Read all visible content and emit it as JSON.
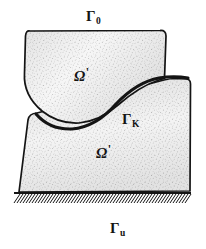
{
  "figure": {
    "background_color": "#ffffff",
    "ink_color": "#141414",
    "fill_color": "#fbfbfb",
    "stipple_color": "#8a8a8a",
    "labels": [
      {
        "id": "gamma-0",
        "name": "gamma-zero-label",
        "base": "Γ",
        "subscript": "0",
        "prime": "",
        "meaning": "traction / free boundary of upper body",
        "x": 86,
        "y": 8
      },
      {
        "id": "omega-upper",
        "name": "omega-upper-label",
        "base": "Ω",
        "subscript": "",
        "prime": "'",
        "meaning": "upper body domain",
        "x": 74,
        "y": 66
      },
      {
        "id": "gamma-k",
        "name": "gamma-k-label",
        "base": "Γ",
        "subscript": "K",
        "prime": "",
        "meaning": "contact boundary between bodies",
        "x": 122,
        "y": 111
      },
      {
        "id": "omega-lower",
        "name": "omega-lower-label",
        "base": "Ω",
        "subscript": "",
        "prime": "'",
        "meaning": "lower body domain",
        "x": 96,
        "y": 143
      },
      {
        "id": "gamma-u",
        "name": "gamma-u-label",
        "base": "Γ",
        "subscript": "u",
        "prime": "",
        "meaning": "fixed displacement boundary at base",
        "x": 110,
        "y": 220
      }
    ],
    "geometry": {
      "upper_body": {
        "name": "upper-body-shape",
        "path": "M 30 31 Q 26 30 25.5 36 L 24.5 73 Q 23 95 42 111 Q 58 124 79 123 Q 100 121 118 105 Q 140 86 159 80 L 164.5 78.5 L 166 36 Q 166 30 160 30.5 Z"
      },
      "lower_body": {
        "name": "lower-body-shape",
        "path": "M 37 113 L 164 80 Q 170 78.5 175 78.5 L 186 79 Q 190.5 79 190.5 84 L 190 191 L 19 192 L 28 120 Q 29 113.5 37 113 Z"
      },
      "contact_curve": {
        "name": "contact-curve-gamma-k",
        "path": "M 36 114 Q 50 130 72 129 Q 96 127 116 104 Q 137 82 159 78 Q 174 75.5 188 78"
      },
      "ground_line": {
        "name": "ground-line",
        "y": 193,
        "x_start": 14,
        "x_end": 191
      },
      "hatching": {
        "name": "ground-hatching",
        "count": 58,
        "angle_dx": -7,
        "length": 9,
        "x_start": 17,
        "x_end": 192,
        "y_top": 194,
        "y_bottom": 203
      }
    }
  }
}
